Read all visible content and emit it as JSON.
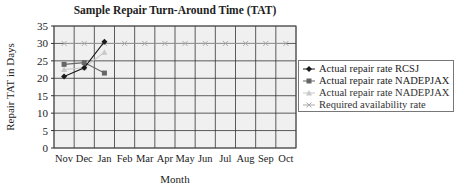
{
  "chart_data": {
    "type": "line",
    "title": "Sample Repair Turn-Around Time (TAT)",
    "xlabel": "Month",
    "ylabel": "Repair TAT in Days",
    "categories": [
      "Nov",
      "Dec",
      "Jan",
      "Feb",
      "Mar",
      "Apr",
      "May",
      "Jun",
      "Jul",
      "Aug",
      "Sep",
      "Oct"
    ],
    "ylim": [
      0,
      35
    ],
    "yticks": [
      0,
      5,
      10,
      15,
      20,
      25,
      30,
      35
    ],
    "grid": true,
    "legend_position": "right",
    "series": [
      {
        "name": "Actual repair rate RCSJ",
        "color": "#1a1a1a",
        "marker": "diamond",
        "values": [
          20.5,
          23,
          30.5,
          null,
          null,
          null,
          null,
          null,
          null,
          null,
          null,
          null
        ]
      },
      {
        "name": "Actual repair rate NADEPJAX",
        "color": "#666666",
        "marker": "square",
        "values": [
          24,
          24.5,
          21.5,
          null,
          null,
          null,
          null,
          null,
          null,
          null,
          null,
          null
        ]
      },
      {
        "name": "Actual repair rate NADEPJAX",
        "color": "#c8c8c8",
        "marker": "triangle",
        "values": [
          22.5,
          23,
          27.5,
          null,
          null,
          null,
          null,
          null,
          null,
          null,
          null,
          null
        ]
      },
      {
        "name": "Required availability rate",
        "color": "#aaaaaa",
        "marker": "x",
        "values": [
          30,
          30,
          30,
          30,
          30,
          30,
          30,
          30,
          30,
          30,
          30,
          30
        ]
      }
    ]
  }
}
